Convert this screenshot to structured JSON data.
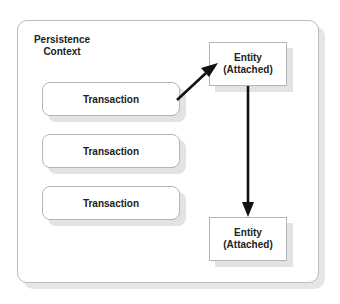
{
  "diagram": {
    "container": {
      "label_line1": "Persistence",
      "label_line2": "Context"
    },
    "transactions": [
      {
        "label": "Transaction"
      },
      {
        "label": "Transaction"
      },
      {
        "label": "Transaction"
      }
    ],
    "entities": [
      {
        "line1": "Entity",
        "line2": "(Attached)"
      },
      {
        "line1": "Entity",
        "line2": "(Attached)"
      }
    ],
    "arrows": [
      {
        "from": "transaction-1",
        "to": "entity-1",
        "direction": "diagonal-up-right"
      },
      {
        "from": "entity-1",
        "to": "entity-2",
        "direction": "down"
      }
    ],
    "colors": {
      "border": "#b5b5b5",
      "shadow": "#e3e3e3",
      "text": "#222222",
      "arrow": "#111111"
    }
  }
}
